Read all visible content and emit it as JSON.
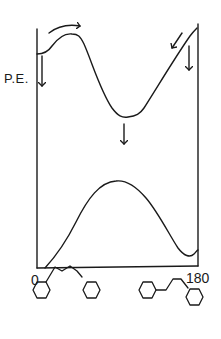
{
  "figure": {
    "type": "potential-energy-diagram",
    "y_axis_label": "P.E.",
    "x_axis_ticks": [
      "0",
      "180"
    ],
    "curves": [
      {
        "name": "upper-curve",
        "description": "potential energy curve with small barrier near 0 and deep minimum near middle"
      },
      {
        "name": "lower-curve",
        "description": "potential energy curve with maximum near middle and minima at ends"
      }
    ],
    "arrows": [
      {
        "name": "barrier-crossing-arrow",
        "direction": "curved-right"
      },
      {
        "name": "left-down-arrow",
        "direction": "down"
      },
      {
        "name": "middle-down-arrow",
        "direction": "down"
      },
      {
        "name": "right-slope-arrow",
        "direction": "down-left"
      },
      {
        "name": "right-down-arrow",
        "direction": "down"
      }
    ],
    "structures": [
      {
        "name": "extended-conformer",
        "at_tick": "0",
        "description": "two cyclohexane rings linked by an extended chain"
      },
      {
        "name": "folded-conformer",
        "at_tick": "180",
        "description": "two cyclohexane rings linked by a folded chain"
      }
    ],
    "stroke_color": "#1a1a1a"
  }
}
